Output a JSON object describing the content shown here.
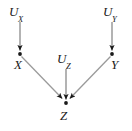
{
  "figure": {
    "type": "causal-dag",
    "title": "",
    "width": 132,
    "height": 131,
    "background_color": "#ffffff",
    "edge_color": "#9a9a9a",
    "arrowhead_color": "#1a1a1a",
    "node_dot_color": "#1a1a1a",
    "label_color": "#1a1a1a"
  },
  "nodes": [
    {
      "id": "UX",
      "base": "U",
      "subscript": "X",
      "label": "U_X",
      "kind": "exogenous",
      "x": 20,
      "y": 20,
      "has_dot": false
    },
    {
      "id": "UY",
      "base": "U",
      "subscript": "Y",
      "label": "U_Y",
      "kind": "exogenous",
      "x": 112,
      "y": 20,
      "has_dot": false
    },
    {
      "id": "UZ",
      "base": "U",
      "subscript": "Z",
      "label": "U_Z",
      "kind": "exogenous",
      "x": 66,
      "y": 66,
      "has_dot": false
    },
    {
      "id": "X",
      "base": "X",
      "subscript": "",
      "label": "X",
      "kind": "endogenous",
      "x": 20,
      "y": 54,
      "has_dot": true
    },
    {
      "id": "Y",
      "base": "Y",
      "subscript": "",
      "label": "Y",
      "kind": "endogenous",
      "x": 112,
      "y": 54,
      "has_dot": true
    },
    {
      "id": "Z",
      "base": "Z",
      "subscript": "",
      "label": "Z",
      "kind": "endogenous",
      "x": 66,
      "y": 103,
      "has_dot": true
    }
  ],
  "edges": [
    {
      "id": "ux-to-x",
      "from": "UX",
      "to": "X",
      "x1": 20,
      "y1": 22,
      "x2": 20,
      "y2": 51
    },
    {
      "id": "uy-to-y",
      "from": "UY",
      "to": "Y",
      "x1": 112,
      "y1": 22,
      "x2": 112,
      "y2": 51
    },
    {
      "id": "uz-to-z",
      "from": "UZ",
      "to": "Z",
      "x1": 66,
      "y1": 69,
      "x2": 66,
      "y2": 100
    },
    {
      "id": "x-to-z",
      "from": "X",
      "to": "Z",
      "x1": 22,
      "y1": 57,
      "x2": 62,
      "y2": 99
    },
    {
      "id": "y-to-z",
      "from": "Y",
      "to": "Z",
      "x1": 110,
      "y1": 57,
      "x2": 70,
      "y2": 99
    }
  ]
}
